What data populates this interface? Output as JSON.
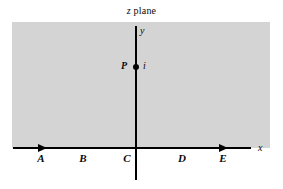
{
  "figure": {
    "title": {
      "variable": "z",
      "text": " plane",
      "full": "z plane"
    },
    "background_color": "#ffffff",
    "shaded_region": {
      "name": "upper-half-plane",
      "color": "#d4d4d4"
    },
    "axes": {
      "x_label": "x",
      "y_label": "y",
      "line_color": "#000000"
    },
    "segments": [
      {
        "label": "A"
      },
      {
        "label": "B"
      },
      {
        "label": "C"
      },
      {
        "label": "D"
      },
      {
        "label": "E"
      }
    ],
    "marked_point": {
      "label": "P",
      "value": "i"
    },
    "arrowheads": [
      {
        "name": "x-axis-arrow-left",
        "direction": "right"
      },
      {
        "name": "x-axis-arrow-right",
        "direction": "right"
      }
    ]
  }
}
